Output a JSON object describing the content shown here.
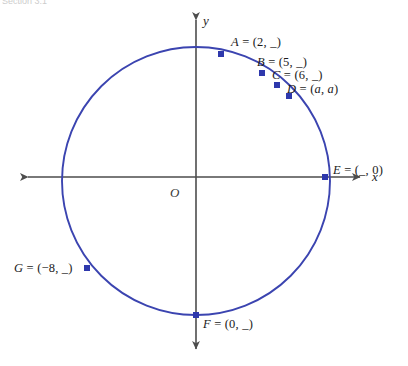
{
  "figure": {
    "header_fragment": "Section 3.1",
    "background_color": "#ffffff",
    "curve_color": "#3b44b0",
    "axis_color": "#4d4d4d",
    "point_color": "#2e38ac",
    "origin_label": "O",
    "x_axis_label": "x",
    "y_axis_label": "y"
  },
  "chart_data": {
    "type": "scatter",
    "title": "",
    "xlabel": "x",
    "ylabel": "y",
    "grid": false,
    "legend": "none",
    "shape": "circle",
    "circle": {
      "center_x": 0,
      "center_y": 0,
      "radius_px": 134,
      "center_px_x": 196,
      "center_px_y": 181,
      "color": "#3b44b0"
    },
    "points": [
      {
        "name": "A",
        "label": "A = (2, _)",
        "px_x": 221,
        "px_y": 54,
        "label_px_x": 231,
        "label_px_y": 36
      },
      {
        "name": "B",
        "label": "B = (5, _)",
        "px_x": 262,
        "px_y": 73,
        "label_px_x": 257,
        "label_px_y": 56
      },
      {
        "name": "C",
        "label": "C = (6, _)",
        "px_x": 277,
        "px_y": 85,
        "label_px_x": 272,
        "label_px_y": 69
      },
      {
        "name": "D",
        "label": "D = (a, a)",
        "px_x": 289,
        "px_y": 96,
        "label_px_x": 287,
        "label_px_y": 83
      },
      {
        "name": "E",
        "label": "E = (_, 0)",
        "px_x": 325,
        "px_y": 177,
        "label_px_x": 333,
        "label_px_y": 164
      },
      {
        "name": "F",
        "label": "F = (0, _)",
        "px_x": 196,
        "px_y": 315,
        "label_px_x": 203,
        "label_px_y": 318
      },
      {
        "name": "G",
        "label": "G = (-8, _)",
        "px_x": 87,
        "px_y": 268,
        "label_px_x": 14,
        "label_px_y": 262
      }
    ],
    "axes": {
      "x_left_px": 22,
      "x_right_px": 366,
      "y_top_px": 14,
      "y_bottom_px": 355,
      "origin_px_x": 196,
      "origin_px_y": 177
    }
  }
}
